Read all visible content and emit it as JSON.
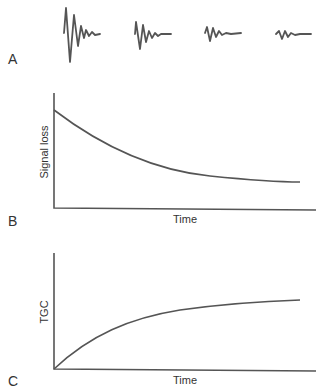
{
  "panels": {
    "a": {
      "letter": "A",
      "description": "Echo waveforms of decreasing amplitude over time",
      "waveforms": [
        {
          "relative_amplitude": 1.0
        },
        {
          "relative_amplitude": 0.6
        },
        {
          "relative_amplitude": 0.35
        },
        {
          "relative_amplitude": 0.25
        }
      ]
    },
    "b": {
      "letter": "B",
      "ylabel": "Signal loss",
      "xlabel": "Time",
      "curve": "exponential decay"
    },
    "c": {
      "letter": "C",
      "ylabel": "TGC",
      "xlabel": "Time",
      "curve": "exponential rise to plateau"
    }
  },
  "colors": {
    "line": "#555555",
    "text": "#333333",
    "background": "#ffffff"
  }
}
